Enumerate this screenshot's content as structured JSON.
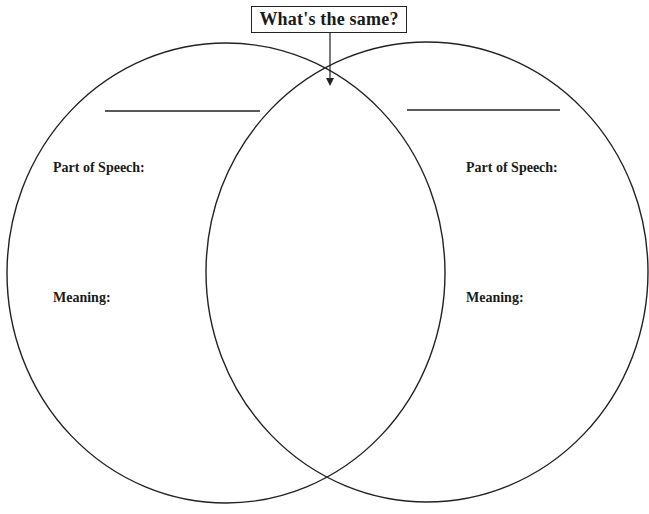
{
  "diagram": {
    "type": "venn",
    "title": "What's the same?",
    "colors": {
      "stroke": "#222222",
      "background": "#ffffff"
    },
    "left_circle": {
      "word_blank": "",
      "part_of_speech_label": "Part of Speech:",
      "meaning_label": "Meaning:"
    },
    "right_circle": {
      "word_blank": "",
      "part_of_speech_label": "Part of Speech:",
      "meaning_label": "Meaning:"
    },
    "overlap": {
      "content": ""
    }
  }
}
